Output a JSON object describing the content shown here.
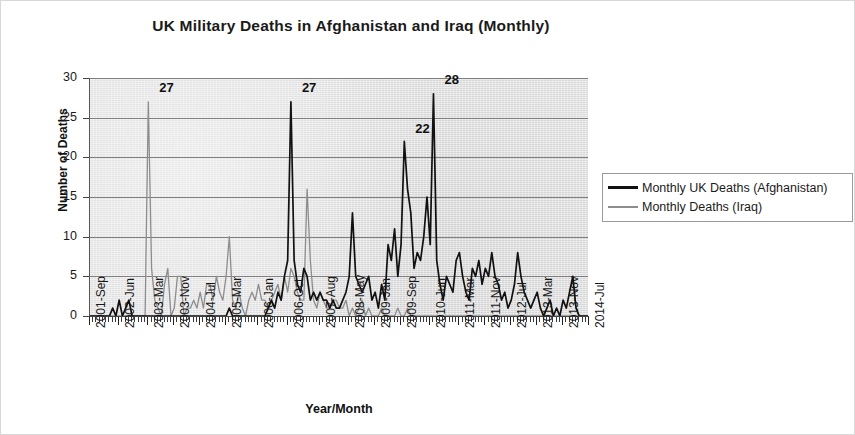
{
  "chart_data": {
    "type": "line",
    "title": "UK Military Deaths in Afghanistan and Iraq (Monthly)",
    "xlabel": "Year/Month",
    "ylabel": "Number of Deaths",
    "ylim": [
      0,
      30
    ],
    "ytick_labels": [
      "30",
      "25",
      "20",
      "15",
      "10",
      "5",
      "0"
    ],
    "ytick_values": [
      30,
      25,
      20,
      15,
      10,
      5,
      0
    ],
    "grid": true,
    "legend_position": "right",
    "x_start": "2001-Sep",
    "x_end": "2014-Jul",
    "xtick_labels": [
      "2001-Sep",
      "2002-Jun",
      "2003-Mar",
      "2003-Nov",
      "2004-Jul",
      "2005-Mar",
      "2006-Jan",
      "2006-Oct",
      "2007-Aug",
      "2008-May",
      "2009-Jan",
      "2009-Sep",
      "2010-Jun",
      "2011-Mar",
      "2011-Nov",
      "2012-Jul",
      "2013-Mar",
      "2013-Nov",
      "2014-Jul"
    ],
    "xtick_indices": [
      0,
      9,
      18,
      26,
      34,
      42,
      52,
      61,
      71,
      80,
      88,
      96,
      105,
      114,
      122,
      130,
      138,
      146,
      154
    ],
    "annotations": [
      {
        "label": "27",
        "series": "Monthly Deaths (Iraq)",
        "x": "2003-Mar",
        "value": 27
      },
      {
        "label": "27",
        "series": "Monthly UK Deaths (Afghanistan)",
        "x": "2006-Sep",
        "value": 27
      },
      {
        "label": "22",
        "series": "Monthly UK Deaths (Afghanistan)",
        "x": "2009-Jul",
        "value": 22
      },
      {
        "label": "28",
        "series": "Monthly UK Deaths (Afghanistan)",
        "x": "2009-Nov",
        "value": 28
      }
    ],
    "series": [
      {
        "name": "Monthly UK Deaths (Afghanistan)",
        "color": "#111111",
        "values": [
          0,
          0,
          0,
          0,
          0,
          0,
          0,
          1,
          0,
          2,
          0,
          1,
          2,
          0,
          0,
          0,
          0,
          0,
          0,
          0,
          0,
          0,
          0,
          0,
          0,
          0,
          0,
          0,
          0,
          0,
          0,
          0,
          0,
          0,
          0,
          0,
          0,
          0,
          0,
          0,
          0,
          0,
          0,
          1,
          0,
          0,
          0,
          0,
          0,
          0,
          0,
          0,
          0,
          0,
          0,
          1,
          2,
          1,
          3,
          2,
          5,
          7,
          27,
          7,
          4,
          3,
          6,
          5,
          2,
          3,
          2,
          3,
          2,
          2,
          1,
          2,
          1,
          1,
          2,
          3,
          5,
          13,
          5,
          4,
          3,
          4,
          5,
          2,
          3,
          1,
          4,
          2,
          9,
          7,
          11,
          5,
          9,
          22,
          16,
          13,
          6,
          8,
          7,
          10,
          15,
          9,
          28,
          7,
          4,
          2,
          5,
          4,
          3,
          7,
          8,
          5,
          3,
          2,
          6,
          5,
          7,
          4,
          6,
          5,
          8,
          5,
          4,
          2,
          3,
          1,
          2,
          4,
          8,
          5,
          3,
          2,
          1,
          2,
          3,
          1,
          0,
          1,
          2,
          0,
          1,
          0,
          2,
          1,
          3,
          5,
          1,
          0,
          0,
          0,
          0
        ]
      },
      {
        "name": "Monthly Deaths (Iraq)",
        "color": "#8d8d8d",
        "values": [
          0,
          0,
          0,
          0,
          0,
          0,
          0,
          0,
          0,
          0,
          0,
          0,
          0,
          0,
          0,
          0,
          0,
          0,
          27,
          6,
          2,
          1,
          0,
          4,
          6,
          0,
          1,
          5,
          5,
          0,
          1,
          1,
          2,
          1,
          3,
          1,
          4,
          4,
          2,
          5,
          3,
          2,
          5,
          10,
          2,
          1,
          3,
          1,
          0,
          2,
          3,
          2,
          4,
          2,
          2,
          1,
          2,
          3,
          4,
          2,
          5,
          3,
          6,
          5,
          3,
          2,
          2,
          16,
          7,
          2,
          1,
          3,
          2,
          1,
          1,
          2,
          2,
          1,
          1,
          2,
          0,
          1,
          0,
          1,
          2,
          0,
          1,
          0,
          0,
          0,
          1,
          0,
          0,
          0,
          0,
          1,
          0,
          0,
          1,
          0,
          0,
          0,
          0,
          0,
          0,
          0,
          0,
          0,
          0,
          0,
          0,
          0,
          0,
          0,
          0,
          0,
          0,
          0,
          0,
          0,
          0,
          0,
          0,
          0,
          0,
          0,
          0,
          0,
          0,
          0,
          0,
          0,
          0,
          0,
          0,
          0,
          0,
          0,
          0,
          0,
          0,
          0,
          0,
          0,
          0,
          0,
          0,
          0,
          0,
          0,
          0,
          0,
          0,
          0,
          0
        ]
      }
    ]
  },
  "legend": {
    "items": [
      {
        "label": "Monthly UK Deaths (Afghanistan)",
        "swatch": "afghanistan-line-swatch"
      },
      {
        "label": "Monthly Deaths (Iraq)",
        "swatch": "iraq-line-swatch"
      }
    ]
  }
}
